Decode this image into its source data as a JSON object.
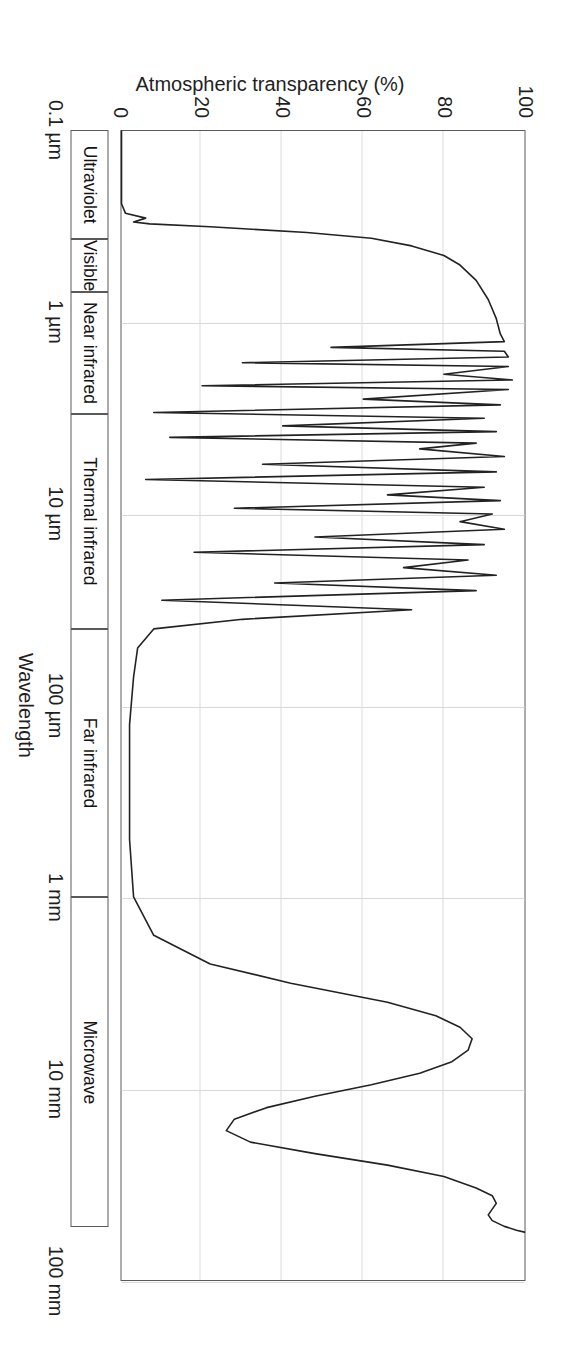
{
  "chart_data": {
    "type": "line",
    "title": "",
    "xlabel": "Wavelength",
    "ylabel": "Atmospheric transparency (%)",
    "ylim": [
      0,
      100
    ],
    "xlim_log_um": [
      -1,
      5
    ],
    "grid": true,
    "legend": "none",
    "y_ticks": [
      "0",
      "20",
      "40",
      "60",
      "80",
      "100"
    ],
    "y_tick_values": [
      0,
      20,
      40,
      60,
      80,
      100
    ],
    "x_ticks": [
      "0.1 µm",
      "1 µm",
      "10 µm",
      "100 µm",
      "1 mm",
      "10 mm",
      "100 mm"
    ],
    "x_tick_log_um": [
      -1,
      0,
      1,
      2,
      3,
      4,
      5
    ],
    "bands": [
      {
        "label": "Ultraviolet",
        "start_log_um": -1.0,
        "end_log_um": -0.43
      },
      {
        "label": "Visible",
        "start_log_um": -0.43,
        "end_log_um": -0.155
      },
      {
        "label": "Near infrared",
        "start_log_um": -0.155,
        "end_log_um": 0.48
      },
      {
        "label": "Thermal infrared",
        "start_log_um": 0.48,
        "end_log_um": 1.6
      },
      {
        "label": "Far infrared",
        "start_log_um": 1.6,
        "end_log_um": 3.0
      },
      {
        "label": "Microwave",
        "start_log_um": 3.0,
        "end_log_um": 4.72
      }
    ],
    "series": [
      {
        "name": "Atmospheric transparency",
        "description": "Transparency envelope versus wavelength on a log scale",
        "points_log_um_pct": [
          [
            -1.0,
            0
          ],
          [
            -0.72,
            0
          ],
          [
            -0.62,
            0
          ],
          [
            -0.57,
            1
          ],
          [
            -0.545,
            6
          ],
          [
            -0.525,
            3
          ],
          [
            -0.515,
            7
          ],
          [
            -0.5,
            22
          ],
          [
            -0.47,
            46
          ],
          [
            -0.44,
            62
          ],
          [
            -0.4,
            72
          ],
          [
            -0.35,
            80
          ],
          [
            -0.3,
            84
          ],
          [
            -0.22,
            88
          ],
          [
            -0.12,
            91
          ],
          [
            -0.02,
            93
          ],
          [
            0.06,
            94
          ],
          [
            0.1,
            95
          ],
          [
            0.13,
            52
          ],
          [
            0.15,
            95
          ],
          [
            0.18,
            96
          ],
          [
            0.21,
            30
          ],
          [
            0.23,
            96
          ],
          [
            0.27,
            80
          ],
          [
            0.3,
            97
          ],
          [
            0.33,
            20
          ],
          [
            0.35,
            96
          ],
          [
            0.4,
            60
          ],
          [
            0.43,
            94
          ],
          [
            0.47,
            8
          ],
          [
            0.5,
            90
          ],
          [
            0.54,
            40
          ],
          [
            0.57,
            93
          ],
          [
            0.6,
            12
          ],
          [
            0.63,
            88
          ],
          [
            0.66,
            74
          ],
          [
            0.7,
            95
          ],
          [
            0.74,
            35
          ],
          [
            0.78,
            93
          ],
          [
            0.82,
            6
          ],
          [
            0.86,
            90
          ],
          [
            0.9,
            66
          ],
          [
            0.93,
            94
          ],
          [
            0.97,
            28
          ],
          [
            1.0,
            92
          ],
          [
            1.04,
            84
          ],
          [
            1.08,
            95
          ],
          [
            1.12,
            48
          ],
          [
            1.16,
            90
          ],
          [
            1.2,
            18
          ],
          [
            1.24,
            86
          ],
          [
            1.28,
            70
          ],
          [
            1.32,
            93
          ],
          [
            1.36,
            38
          ],
          [
            1.4,
            88
          ],
          [
            1.45,
            10
          ],
          [
            1.5,
            72
          ],
          [
            1.55,
            30
          ],
          [
            1.6,
            8
          ],
          [
            1.7,
            4
          ],
          [
            1.85,
            3
          ],
          [
            2.1,
            2
          ],
          [
            2.4,
            2
          ],
          [
            2.7,
            2
          ],
          [
            3.0,
            3
          ],
          [
            3.2,
            8
          ],
          [
            3.35,
            22
          ],
          [
            3.45,
            42
          ],
          [
            3.55,
            66
          ],
          [
            3.62,
            78
          ],
          [
            3.68,
            84
          ],
          [
            3.74,
            87
          ],
          [
            3.8,
            86
          ],
          [
            3.86,
            82
          ],
          [
            3.92,
            74
          ],
          [
            3.98,
            62
          ],
          [
            4.04,
            48
          ],
          [
            4.1,
            36
          ],
          [
            4.16,
            28
          ],
          [
            4.22,
            26
          ],
          [
            4.28,
            32
          ],
          [
            4.34,
            48
          ],
          [
            4.4,
            66
          ],
          [
            4.46,
            80
          ],
          [
            4.52,
            88
          ],
          [
            4.56,
            92
          ],
          [
            4.6,
            93
          ],
          [
            4.63,
            92
          ],
          [
            4.66,
            91
          ],
          [
            4.69,
            92
          ],
          [
            4.72,
            95
          ],
          [
            4.74,
            98
          ],
          [
            4.75,
            100
          ]
        ]
      }
    ],
    "annotations": [
      {
        "text": "ozone cutoff notch near 0.3 µm"
      },
      {
        "text": "dense water vapour / CO2 absorption lines through near and thermal infrared"
      },
      {
        "text": "near-opaque far infrared window"
      },
      {
        "text": "microwave window opens above ~1 cm"
      }
    ]
  }
}
